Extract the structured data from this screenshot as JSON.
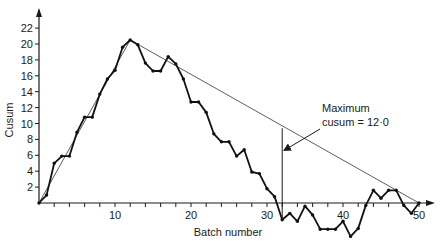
{
  "chart_data": {
    "type": "line",
    "title": "",
    "xlabel": "Batch number",
    "ylabel": "Cusum",
    "xlim": [
      0,
      52
    ],
    "ylim": [
      -5,
      24
    ],
    "grid": false,
    "x_ticks": [
      10,
      20,
      30,
      40,
      50
    ],
    "x_tick_labels": [
      "10",
      "20",
      "30",
      "40",
      "50"
    ],
    "x_minor_tick_step": 2,
    "y_ticks": [
      2,
      4,
      6,
      8,
      10,
      12,
      14,
      16,
      18,
      20,
      22
    ],
    "y_tick_labels": [
      "2",
      "4",
      "6",
      "8",
      "10",
      "12",
      "14",
      "16",
      "18",
      "20",
      "22"
    ],
    "series": [
      {
        "name": "Cusum",
        "style": "line with markers",
        "x": [
          0,
          1,
          2,
          3,
          4,
          5,
          6,
          7,
          8,
          9,
          10,
          11,
          12,
          13,
          14,
          15,
          16,
          17,
          18,
          19,
          20,
          21,
          22,
          23,
          24,
          25,
          26,
          27,
          28,
          29,
          30,
          31,
          32,
          33,
          34,
          35,
          36,
          37,
          38,
          39,
          40,
          41,
          42,
          43,
          44,
          45,
          46,
          47,
          48,
          49,
          50
        ],
        "values": [
          0,
          1.0,
          5.0,
          5.9,
          5.9,
          8.9,
          10.8,
          10.8,
          13.7,
          15.6,
          16.7,
          19.6,
          20.5,
          19.9,
          17.6,
          16.6,
          16.6,
          18.4,
          17.5,
          15.6,
          12.7,
          12.7,
          11.4,
          8.7,
          7.7,
          7.7,
          5.9,
          6.7,
          3.9,
          3.7,
          1.8,
          0.8,
          -2.1,
          -1.3,
          -2.3,
          -0.4,
          -1.5,
          -3.3,
          -3.3,
          -3.3,
          -2.3,
          -4.2,
          -3.2,
          -0.3,
          1.6,
          0.6,
          1.6,
          1.6,
          -0.3,
          -1.3,
          0
        ]
      },
      {
        "name": "Trend lines",
        "style": "thin line",
        "segments": [
          {
            "x": [
              0,
              12
            ],
            "y": [
              0,
              20.5
            ]
          },
          {
            "x": [
              12,
              50
            ],
            "y": [
              20.5,
              0
            ]
          }
        ]
      }
    ],
    "annotations": [
      {
        "text": "Maximum",
        "x": 37,
        "y": 12.2
      },
      {
        "text": "cusum = 12·0",
        "x": 37,
        "y": 10.6
      },
      {
        "type": "vertical-line",
        "x": 32,
        "y_from": -2.1,
        "y_to": 9.4
      },
      {
        "type": "arrow",
        "from": [
          35,
          8
        ],
        "to": [
          32.1,
          6.6
        ]
      }
    ]
  },
  "labels": {
    "ylabel": "Cusum",
    "xlabel": "Batch number",
    "annotation_line1": "Maximum",
    "annotation_line2": "cusum = 12·0"
  }
}
